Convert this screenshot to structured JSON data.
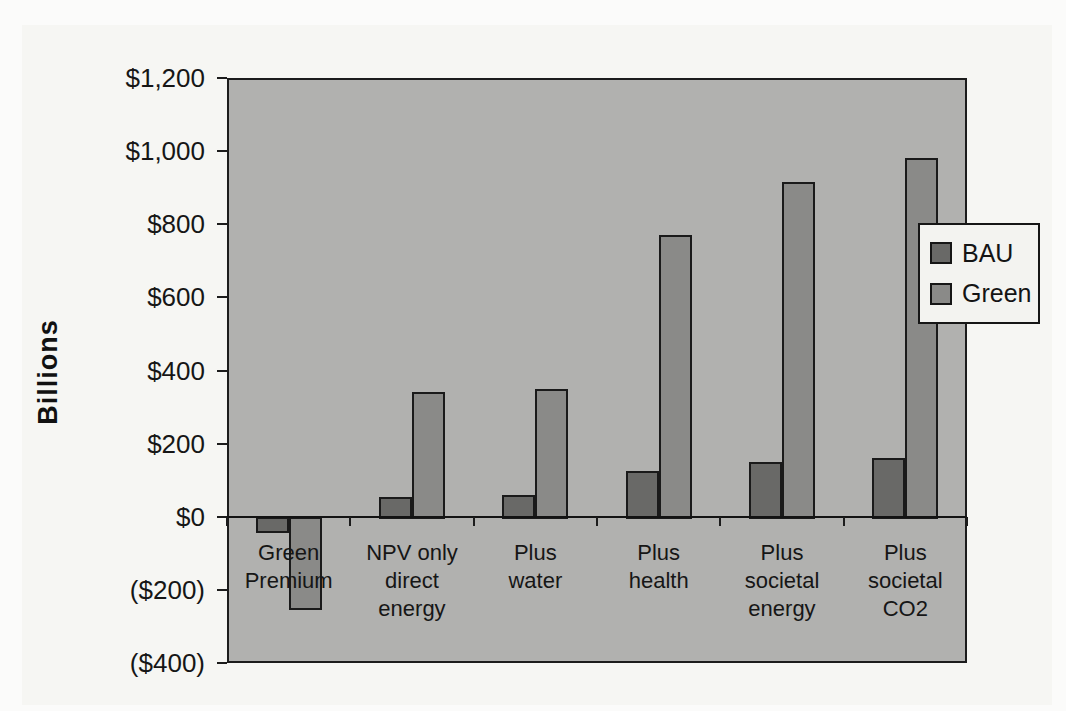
{
  "figure": {
    "background_color": "#f6f6f3",
    "axis_color": "#1c1c1c"
  },
  "chart_data": {
    "type": "bar",
    "title": "",
    "xlabel": "",
    "ylabel": "Billions",
    "categories": [
      "Green Premium",
      "NPV only direct energy",
      "Plus water",
      "Plus health",
      "Plus societal energy",
      "Plus societal CO2"
    ],
    "category_label_lines": [
      [
        "Green",
        "Premium"
      ],
      [
        "NPV only",
        "direct",
        "energy"
      ],
      [
        "Plus",
        "water"
      ],
      [
        "Plus",
        "health"
      ],
      [
        "Plus",
        "societal",
        "energy"
      ],
      [
        "Plus",
        "societal",
        "CO2"
      ]
    ],
    "series": [
      {
        "name": "BAU",
        "color": "#696967",
        "values": [
          -40,
          55,
          60,
          125,
          150,
          160
        ]
      },
      {
        "name": "Green",
        "color": "#8a8a88",
        "values": [
          -250,
          340,
          350,
          770,
          915,
          980
        ]
      }
    ],
    "ylim": [
      -400,
      1200
    ],
    "ytick_step": 200,
    "yticks": [
      {
        "value": 1200,
        "label": "$1,200"
      },
      {
        "value": 1000,
        "label": "$1,000"
      },
      {
        "value": 800,
        "label": "$800"
      },
      {
        "value": 600,
        "label": "$600"
      },
      {
        "value": 400,
        "label": "$400"
      },
      {
        "value": 200,
        "label": "$200"
      },
      {
        "value": 0,
        "label": "$0"
      },
      {
        "value": -200,
        "label": "($200)"
      },
      {
        "value": -400,
        "label": "($400)"
      }
    ],
    "grid": false,
    "plot_bg": "#b1b1af",
    "legend_position": "right-overlapping-plot",
    "legend": [
      {
        "label": "BAU",
        "color": "#696967"
      },
      {
        "label": "Green",
        "color": "#8a8a88"
      }
    ]
  }
}
